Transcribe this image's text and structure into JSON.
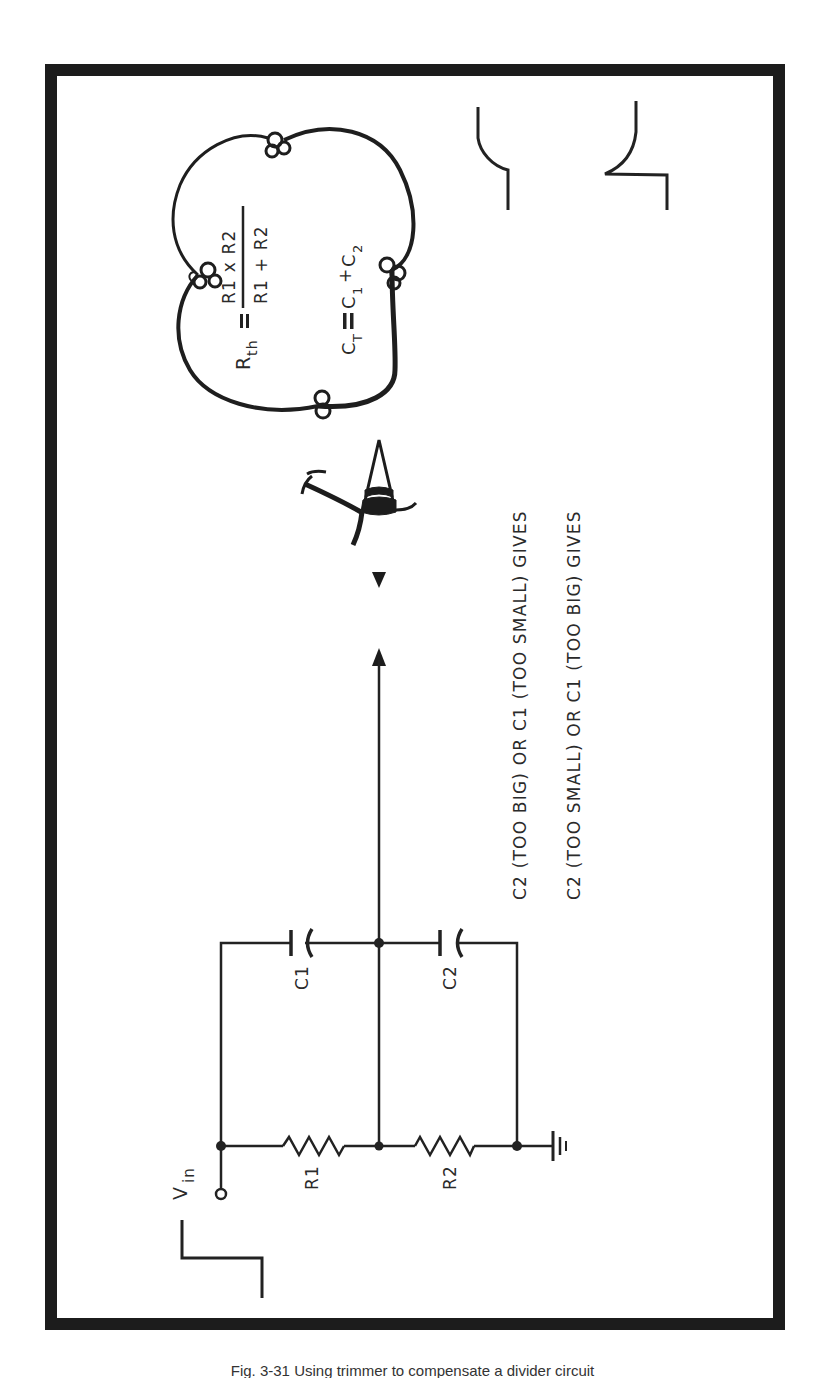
{
  "figure": {
    "orientation": "rotated-90-ccw",
    "border_color": "#1c1c1c",
    "ink_color": "#222222",
    "formulas": {
      "rth_lhs": "R",
      "rth_sub": "th",
      "rth_equals": "=",
      "rth_numerator": "R1 x R2",
      "rth_denominator": "R1 + R2",
      "ct_lhs": "C",
      "ct_sub": "T",
      "ct_equals": "=",
      "ct_c1": "C",
      "ct_c1_sub": "1",
      "ct_plus": "+",
      "ct_c2": "C",
      "ct_c2_sub": "2"
    },
    "statements": [
      "C2 (TOO BIG) OR C1 (TOO SMALL) GIVES",
      "C2 (TOO SMALL) OR C1 (TOO BIG) GIVES"
    ],
    "circuit": {
      "input_label": "V",
      "input_label_sub": "in",
      "resistors": [
        "R1",
        "R2"
      ],
      "capacitors": [
        "C1",
        "C2"
      ]
    },
    "caption": "Fig. 3-31  Using trimmer to compensate a divider circuit"
  }
}
